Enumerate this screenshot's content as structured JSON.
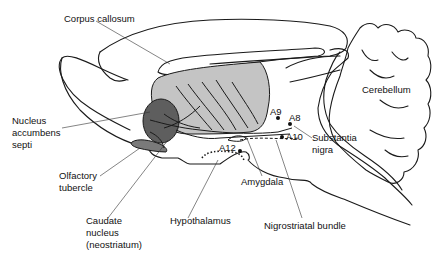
{
  "diagram": {
    "colors": {
      "outline": "#1a1a1a",
      "striatum_fill": "#c4c4c4",
      "accumbens_fill": "#5e5e5e",
      "tubercle_fill": "#7a7a7a",
      "background": "#ffffff"
    },
    "labels": {
      "corpus_callosum": "Corpus callosum",
      "cerebellum": "Cerebellum",
      "nucleus_accumbens_line1": "Nucleus",
      "nucleus_accumbens_line2": "accumbens",
      "nucleus_accumbens_line3": "septi",
      "olfactory_tubercle_line1": "Olfactory",
      "olfactory_tubercle_line2": "tubercle",
      "caudate_line1": "Caudate",
      "caudate_line2": "nucleus",
      "caudate_line3": "(neostriatum)",
      "hypothalamus": "Hypothalamus",
      "amygdala": "Amygdala",
      "nigrostriatal_bundle": "Nigrostriatal bundle",
      "substantia_nigra_line1": "Substantia",
      "substantia_nigra_line2": "nigra",
      "a9": "A9",
      "a8": "A8",
      "a10": "A10",
      "a12": "A12"
    }
  }
}
